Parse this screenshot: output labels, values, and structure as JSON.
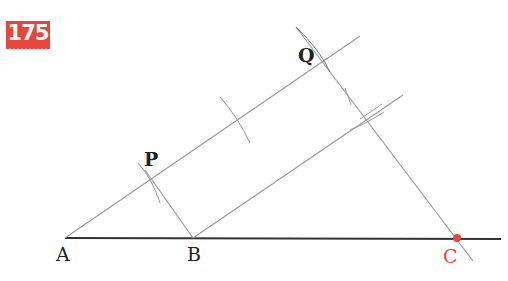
{
  "problem_number": "175",
  "points": {
    "A": {
      "label": "A",
      "x": 65,
      "y": 238
    },
    "B": {
      "label": "B",
      "x": 193,
      "y": 238
    },
    "C": {
      "label": "C",
      "x": 457,
      "y": 238,
      "highlight": true
    },
    "P": {
      "label": "P",
      "x": 151,
      "y": 178
    },
    "Q": {
      "label": "Q",
      "x": 325,
      "y": 60
    }
  },
  "colors": {
    "accent": "#e8463a",
    "line": "#888888",
    "baseline": "#333333",
    "text": "#222222"
  }
}
